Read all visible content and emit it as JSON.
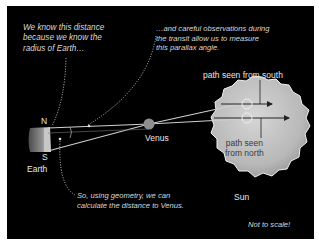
{
  "annotations": {
    "radius_note": [
      "We know this distance",
      "because we know the",
      "radius of Earth…"
    ],
    "observation_note": [
      "…and careful observations during",
      "the transit allow us to measure",
      "this parallax angle."
    ],
    "geometry_note": [
      "So, using geometry, we can",
      "calculate the distance to Venus."
    ],
    "scale_note": "Not to scale!"
  },
  "bodies": {
    "earth": {
      "label": "Earth",
      "north": "N",
      "south": "S"
    },
    "venus": {
      "label": "Venus"
    },
    "sun": {
      "label": "Sun"
    }
  },
  "paths": {
    "south": "path seen from south",
    "north_line1": "path seen",
    "north_line2": "from north"
  },
  "colors": {
    "background": "#000000",
    "sun_fill": "#bdbdbd",
    "lines": "#d0d0d0",
    "venus": "#8f8f8f"
  }
}
